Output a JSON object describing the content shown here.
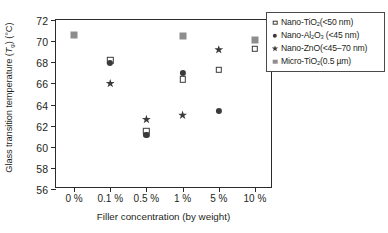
{
  "chart_data": {
    "type": "scatter",
    "title": "",
    "xlabel": "Filler concentration (by weight)",
    "ylabel_plain": "Glass transition temperature (Tg) (°C)",
    "ylabel_parts": {
      "lead": "Glass transition temperature (",
      "italic_symbol": "T",
      "subscript": "g",
      "mid": ") (",
      "unit": "°C",
      "tail": ")"
    },
    "categories": [
      "0 %",
      "0.1 %",
      "0.5 %",
      "1 %",
      "5 %",
      "10 %"
    ],
    "ylim": [
      56,
      72
    ],
    "yticks": [
      56,
      58,
      60,
      62,
      64,
      66,
      68,
      70,
      72
    ],
    "grid": false,
    "legend_position": "outside-top-right",
    "series": [
      {
        "name": "Nano-TiO2 (<50 nm)",
        "marker": "open-square",
        "color": "#3a3a3a",
        "points": [
          {
            "x": "0.1 %",
            "y": 68.2
          },
          {
            "x": "0.5 %",
            "y": 61.5
          },
          {
            "x": "1 %",
            "y": 66.4
          },
          {
            "x": "5 %",
            "y": 67.3
          },
          {
            "x": "10 %",
            "y": 69.3
          }
        ]
      },
      {
        "name": "Nano-Al2O3 (<45 nm)",
        "marker": "filled-circle",
        "color": "#3a3a3a",
        "points": [
          {
            "x": "0.1 %",
            "y": 67.9
          },
          {
            "x": "0.5 %",
            "y": 61.1
          },
          {
            "x": "1 %",
            "y": 67.0
          },
          {
            "x": "5 %",
            "y": 63.4
          }
        ]
      },
      {
        "name": "Nano-ZnO (<45-70 nm)",
        "marker": "star",
        "color": "#3a3a3a",
        "points": [
          {
            "x": "0.1 %",
            "y": 66.0
          },
          {
            "x": "0.5 %",
            "y": 62.6
          },
          {
            "x": "1 %",
            "y": 63.0
          },
          {
            "x": "5 %",
            "y": 69.2
          }
        ]
      },
      {
        "name": "Micro-TiO2 (0.5 um)",
        "marker": "grey-square",
        "color": "#8d8d8d",
        "points": [
          {
            "x": "0 %",
            "y": 70.55
          },
          {
            "x": "1 %",
            "y": 70.5
          },
          {
            "x": "10 %",
            "y": 70.1
          }
        ]
      }
    ]
  },
  "legend": {
    "entries": [
      {
        "marker": "open-square",
        "text_parts": {
          "a": "Nano-TiO",
          "sub": "2",
          "b": "(<50 nm)"
        }
      },
      {
        "marker": "filled-circle",
        "text_parts": {
          "a": "Nano-Al",
          "sub": "2",
          "mid": "O",
          "sub2": "3",
          "b": " (<45 nm)"
        }
      },
      {
        "marker": "star",
        "text_parts": {
          "a": "Nano-ZnO(<45–70 nm)"
        }
      },
      {
        "marker": "grey-square",
        "text_parts": {
          "a": "Micro-TiO",
          "sub": "2",
          "b": "(0.5 µm)"
        }
      }
    ]
  }
}
